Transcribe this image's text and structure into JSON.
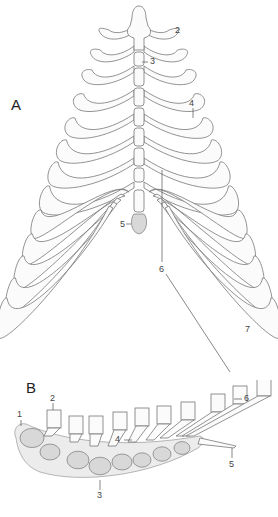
{
  "figure": {
    "panels": [
      {
        "id": "A",
        "label": "A",
        "view": "ventral view of rib cage and sternum",
        "callouts": [
          "2",
          "3",
          "4",
          "5",
          "6",
          "7"
        ]
      },
      {
        "id": "B",
        "label": "B",
        "view": "lateral view of sternum with costal cartilages",
        "callouts": [
          "1",
          "2",
          "3",
          "4",
          "5",
          "6"
        ]
      }
    ]
  },
  "panel_a": {
    "label": "A",
    "callouts": {
      "c2": "2",
      "c3": "3",
      "c4": "4",
      "c5": "5",
      "c6": "6",
      "c7": "7"
    }
  },
  "panel_b": {
    "label": "B",
    "callouts": {
      "c1": "1",
      "c2": "2",
      "c3": "3",
      "c4": "4",
      "c5": "5",
      "c6": "6"
    }
  }
}
